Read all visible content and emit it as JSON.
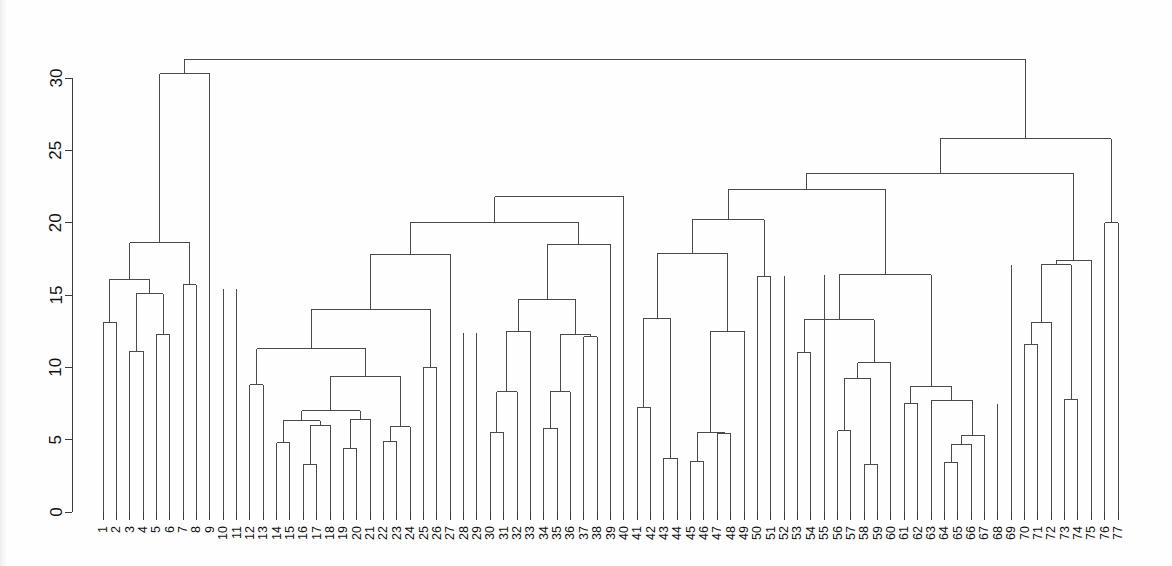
{
  "chart_data": {
    "type": "dendrogram",
    "title": "",
    "subtitle": "",
    "xlabel": "",
    "ylabel": "",
    "grid": false,
    "legend": "none",
    "orientation": "vertical",
    "ylim": [
      0,
      31.5
    ],
    "y_ticks": [
      0,
      5,
      10,
      15,
      20,
      25,
      30
    ],
    "y_tick_labels": [
      "0",
      "5",
      "10",
      "15",
      "20",
      "25",
      "30"
    ],
    "n_leaves": 77,
    "leaf_labels": [
      "1",
      "2",
      "3",
      "4",
      "5",
      "6",
      "7",
      "8",
      "9",
      "10",
      "11",
      "12",
      "13",
      "14",
      "15",
      "16",
      "17",
      "18",
      "19",
      "20",
      "21",
      "22",
      "23",
      "24",
      "25",
      "26",
      "27",
      "28",
      "29",
      "30",
      "31",
      "32",
      "33",
      "34",
      "35",
      "36",
      "37",
      "38",
      "39",
      "40",
      "41",
      "42",
      "43",
      "44",
      "45",
      "46",
      "47",
      "48",
      "49",
      "50",
      "51",
      "52",
      "53",
      "54",
      "55",
      "56",
      "57",
      "58",
      "59",
      "60",
      "61",
      "62",
      "63",
      "64",
      "65",
      "66",
      "67",
      "68",
      "69",
      "70",
      "71",
      "72",
      "73",
      "74",
      "75",
      "76",
      "77"
    ],
    "leaf_order": [
      1,
      2,
      3,
      4,
      5,
      6,
      7,
      8,
      9,
      10,
      11,
      12,
      13,
      14,
      15,
      16,
      17,
      18,
      19,
      20,
      21,
      22,
      23,
      24,
      25,
      26,
      27,
      28,
      29,
      30,
      31,
      32,
      33,
      34,
      35,
      36,
      37,
      38,
      39,
      40,
      41,
      42,
      43,
      44,
      45,
      46,
      47,
      48,
      49,
      50,
      51,
      52,
      53,
      54,
      55,
      56,
      57,
      58,
      59,
      60,
      61,
      62,
      63,
      64,
      65,
      66,
      67,
      68,
      69,
      70,
      71,
      72,
      73,
      74,
      75,
      76,
      77
    ],
    "merges": [
      {
        "id": "m1",
        "left": {
          "leaf": 1
        },
        "right": {
          "leaf": 2
        },
        "height": 13.1
      },
      {
        "id": "m2",
        "left": {
          "leaf": 3
        },
        "right": {
          "leaf": 4
        },
        "height": 11.1
      },
      {
        "id": "m3",
        "left": {
          "leaf": 5
        },
        "right": {
          "leaf": 6
        },
        "height": 12.3
      },
      {
        "id": "m4",
        "left": {
          "node": "m2"
        },
        "right": {
          "node": "m3"
        },
        "height": 15.1
      },
      {
        "id": "m5",
        "left": {
          "node": "m1"
        },
        "right": {
          "node": "m4"
        },
        "height": 16.1
      },
      {
        "id": "m6",
        "left": {
          "leaf": 7
        },
        "right": {
          "leaf": 8
        },
        "height": 15.7
      },
      {
        "id": "m7",
        "left": {
          "node": "m5"
        },
        "right": {
          "node": "m6"
        },
        "height": 18.6
      },
      {
        "id": "m8",
        "left": {
          "leaf": 12
        },
        "right": {
          "leaf": 13
        },
        "height": 8.8
      },
      {
        "id": "m9",
        "left": {
          "leaf": 14
        },
        "right": {
          "leaf": 15
        },
        "height": 4.8
      },
      {
        "id": "m10",
        "left": {
          "leaf": 16
        },
        "right": {
          "leaf": 17
        },
        "height": 3.3
      },
      {
        "id": "m11",
        "left": {
          "node": "m10"
        },
        "right": {
          "leaf": 18
        },
        "height": 6.0
      },
      {
        "id": "m12",
        "left": {
          "node": "m9"
        },
        "right": {
          "node": "m11"
        },
        "height": 6.3
      },
      {
        "id": "m13",
        "left": {
          "leaf": 19
        },
        "right": {
          "leaf": 20
        },
        "height": 4.4
      },
      {
        "id": "m14",
        "left": {
          "node": "m13"
        },
        "right": {
          "leaf": 21
        },
        "height": 6.4
      },
      {
        "id": "m15",
        "left": {
          "node": "m12"
        },
        "right": {
          "node": "m14"
        },
        "height": 7.0
      },
      {
        "id": "m16",
        "left": {
          "leaf": 22
        },
        "right": {
          "leaf": 23
        },
        "height": 4.9
      },
      {
        "id": "m17",
        "left": {
          "node": "m16"
        },
        "right": {
          "leaf": 24
        },
        "height": 5.9
      },
      {
        "id": "m18",
        "left": {
          "node": "m15"
        },
        "right": {
          "node": "m17"
        },
        "height": 9.4
      },
      {
        "id": "m19",
        "left": {
          "node": "m8"
        },
        "right": {
          "node": "m18"
        },
        "height": 11.3
      },
      {
        "id": "m20",
        "left": {
          "leaf": 25
        },
        "right": {
          "leaf": 26
        },
        "height": 10.0
      },
      {
        "id": "m21",
        "left": {
          "node": "m19"
        },
        "right": {
          "node": "m20"
        },
        "height": 14.0
      },
      {
        "id": "m22",
        "left": {
          "node": "m21"
        },
        "right": {
          "leaf": 27
        },
        "height": 17.8
      },
      {
        "id": "m23",
        "left": {
          "leaf": 30
        },
        "right": {
          "leaf": 31
        },
        "height": 5.5
      },
      {
        "id": "m24",
        "left": {
          "node": "m23"
        },
        "right": {
          "leaf": 32
        },
        "height": 8.3
      },
      {
        "id": "m25",
        "left": {
          "node": "m24"
        },
        "right": {
          "leaf": 33
        },
        "height": 12.5
      },
      {
        "id": "m26",
        "left": {
          "leaf": 34
        },
        "right": {
          "leaf": 35
        },
        "height": 5.8
      },
      {
        "id": "m27",
        "left": {
          "node": "m26"
        },
        "right": {
          "leaf": 36
        },
        "height": 8.3
      },
      {
        "id": "m28",
        "left": {
          "leaf": 37
        },
        "right": {
          "leaf": 38
        },
        "height": 12.1
      },
      {
        "id": "m29",
        "left": {
          "node": "m27"
        },
        "right": {
          "node": "m28"
        },
        "height": 12.3
      },
      {
        "id": "m30",
        "left": {
          "node": "m25"
        },
        "right": {
          "node": "m29"
        },
        "height": 14.7
      },
      {
        "id": "m31",
        "left": {
          "node": "m30"
        },
        "right": {
          "leaf": 39
        },
        "height": 18.5
      },
      {
        "id": "m32",
        "left": {
          "node": "m22"
        },
        "right": {
          "node": "m31"
        },
        "height": 20.0
      },
      {
        "id": "m33",
        "left": {
          "node": "m32"
        },
        "right": {
          "leaf": 40
        },
        "height": 21.8
      },
      {
        "id": "m34",
        "left": {
          "leaf": 41
        },
        "right": {
          "leaf": 42
        },
        "height": 7.2
      },
      {
        "id": "m35",
        "left": {
          "leaf": 43
        },
        "right": {
          "leaf": 44
        },
        "height": 3.7
      },
      {
        "id": "m36",
        "left": {
          "node": "m34"
        },
        "right": {
          "node": "m35"
        },
        "height": 13.4
      },
      {
        "id": "m37",
        "left": {
          "leaf": 45
        },
        "right": {
          "leaf": 46
        },
        "height": 3.5
      },
      {
        "id": "m38",
        "left": {
          "leaf": 47
        },
        "right": {
          "leaf": 48
        },
        "height": 5.4
      },
      {
        "id": "m39",
        "left": {
          "node": "m37"
        },
        "right": {
          "node": "m38"
        },
        "height": 5.5
      },
      {
        "id": "m40",
        "left": {
          "node": "m39"
        },
        "right": {
          "leaf": 49
        },
        "height": 12.5
      },
      {
        "id": "m41",
        "left": {
          "node": "m36"
        },
        "right": {
          "node": "m40"
        },
        "height": 17.9
      },
      {
        "id": "m42",
        "left": {
          "leaf": 50
        },
        "right": {
          "leaf": 51
        },
        "height": 16.3
      },
      {
        "id": "m43",
        "left": {
          "node": "m41"
        },
        "right": {
          "node": "m42"
        },
        "height": 20.2
      },
      {
        "id": "m44",
        "left": {
          "leaf": 53
        },
        "right": {
          "leaf": 54
        },
        "height": 11.0
      },
      {
        "id": "m45",
        "left": {
          "leaf": 56
        },
        "right": {
          "leaf": 57
        },
        "height": 5.6
      },
      {
        "id": "m46",
        "left": {
          "leaf": 58
        },
        "right": {
          "leaf": 59
        },
        "height": 3.3
      },
      {
        "id": "m47",
        "left": {
          "node": "m45"
        },
        "right": {
          "node": "m46"
        },
        "height": 9.2
      },
      {
        "id": "m48",
        "left": {
          "node": "m47"
        },
        "right": {
          "leaf": 60
        },
        "height": 10.3
      },
      {
        "id": "m49",
        "left": {
          "node": "m44"
        },
        "right": {
          "node": "m48"
        },
        "height": 13.3
      },
      {
        "id": "m50",
        "left": {
          "leaf": 61
        },
        "right": {
          "leaf": 62
        },
        "height": 7.5
      },
      {
        "id": "m51",
        "left": {
          "leaf": 64
        },
        "right": {
          "leaf": 65
        },
        "height": 3.4
      },
      {
        "id": "m52",
        "left": {
          "node": "m51"
        },
        "right": {
          "leaf": 66
        },
        "height": 4.7
      },
      {
        "id": "m53",
        "left": {
          "node": "m52"
        },
        "right": {
          "leaf": 67
        },
        "height": 5.3
      },
      {
        "id": "m54",
        "left": {
          "leaf": 63
        },
        "right": {
          "node": "m53"
        },
        "height": 7.7
      },
      {
        "id": "m55",
        "left": {
          "node": "m50"
        },
        "right": {
          "node": "m54"
        },
        "height": 8.7
      },
      {
        "id": "m56",
        "left": {
          "node": "m49"
        },
        "right": {
          "node": "m55"
        },
        "height": 16.4
      },
      {
        "id": "m57",
        "left": {
          "node": "m43"
        },
        "right": {
          "node": "m56"
        },
        "height": 22.3
      },
      {
        "id": "m58",
        "left": {
          "leaf": 70
        },
        "right": {
          "leaf": 71
        },
        "height": 11.6
      },
      {
        "id": "m59",
        "left": {
          "node": "m58"
        },
        "right": {
          "leaf": 72
        },
        "height": 13.1
      },
      {
        "id": "m60",
        "left": {
          "leaf": 73
        },
        "right": {
          "leaf": 74
        },
        "height": 7.8
      },
      {
        "id": "m61",
        "left": {
          "node": "m59"
        },
        "right": {
          "node": "m60"
        },
        "height": 17.1
      },
      {
        "id": "m62",
        "left": {
          "node": "m61"
        },
        "right": {
          "leaf": 75
        },
        "height": 17.4
      },
      {
        "id": "m63",
        "left": {
          "node": "m57"
        },
        "right": {
          "node": "m62"
        },
        "height": 23.4
      },
      {
        "id": "m64",
        "left": {
          "leaf": 76
        },
        "right": {
          "leaf": 77
        },
        "height": 20.0
      },
      {
        "id": "m65",
        "left": {
          "node": "m63"
        },
        "right": {
          "node": "m64"
        },
        "height": 25.8
      },
      {
        "id": "m66",
        "left": {
          "node": "m7"
        },
        "right": {
          "leaf": 9
        },
        "height": 30.3
      },
      {
        "id": "m67",
        "left": {
          "node": "m66"
        },
        "right": {
          "node": "m65"
        },
        "height": 31.3
      }
    ],
    "singleton_stems": [
      {
        "leaf": 10,
        "top": 15.4
      },
      {
        "leaf": 11,
        "top": 15.4
      },
      {
        "leaf": 28,
        "top": 12.4
      },
      {
        "leaf": 29,
        "top": 12.4
      },
      {
        "leaf": 52,
        "top": 16.3
      },
      {
        "leaf": 55,
        "top": 16.4
      },
      {
        "leaf": 68,
        "top": 7.5
      },
      {
        "leaf": 69,
        "top": 17.1
      }
    ]
  },
  "axes": {
    "y_axis_name": "height-axis",
    "x_axis_name": "leaf-axis"
  }
}
